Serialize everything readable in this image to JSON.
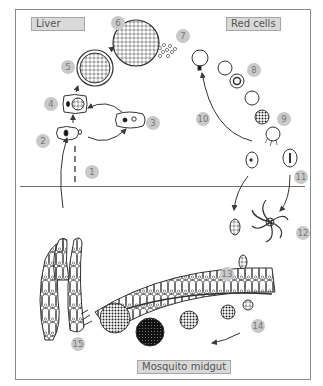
{
  "figure": {
    "caption_fragment": "",
    "regions": {
      "liver": "Liver",
      "red_cells": "Red cells",
      "mosquito_midgut": "Mosquito midgut"
    },
    "stages": [
      {
        "n": "1",
        "x": 85,
        "y": 165
      },
      {
        "n": "2",
        "x": 36,
        "y": 134
      },
      {
        "n": "3",
        "x": 146,
        "y": 116
      },
      {
        "n": "4",
        "x": 44,
        "y": 97
      },
      {
        "n": "5",
        "x": 61,
        "y": 60
      },
      {
        "n": "6",
        "x": 111,
        "y": 16
      },
      {
        "n": "7",
        "x": 176,
        "y": 29
      },
      {
        "n": "8",
        "x": 247,
        "y": 63
      },
      {
        "n": "9",
        "x": 277,
        "y": 112
      },
      {
        "n": "10",
        "x": 196,
        "y": 112
      },
      {
        "n": "11",
        "x": 294,
        "y": 170
      },
      {
        "n": "12",
        "x": 296,
        "y": 226
      },
      {
        "n": "13",
        "x": 220,
        "y": 267
      },
      {
        "n": "14",
        "x": 251,
        "y": 319
      },
      {
        "n": "15",
        "x": 71,
        "y": 337
      }
    ],
    "colors": {
      "line": "#3a3a3a",
      "frame": "#8a8a8a",
      "number_fill": "#c9c9c9",
      "label_fill": "#d9d9d9"
    }
  }
}
